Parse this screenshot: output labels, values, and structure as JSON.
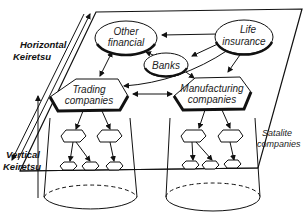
{
  "diagram": {
    "type": "keiretsu-structure",
    "side_labels": {
      "horizontal": [
        "Horizontal",
        "Keiretsu"
      ],
      "vertical": [
        "Vertical",
        "Keiretsu"
      ]
    },
    "nodes": {
      "other_financial": [
        "Other",
        "financial"
      ],
      "life_insurance": [
        "Life",
        "insurance"
      ],
      "banks": "Banks",
      "trading": [
        "Trading",
        "companies"
      ],
      "manufacturing": [
        "Manufacturing",
        "companies"
      ]
    },
    "satellite_label": [
      "Satalite",
      "companies"
    ],
    "edges": [
      {
        "from": "Life insurance",
        "to": "Other financial"
      },
      {
        "from": "Life insurance",
        "to": "Banks"
      },
      {
        "from": "Life insurance",
        "to": "Trading companies"
      },
      {
        "from": "Life insurance",
        "to": "Manufacturing companies"
      },
      {
        "from": "Other financial",
        "to": "Banks",
        "bidirectional": true
      },
      {
        "from": "Other financial",
        "to": "Trading companies",
        "bidirectional": true
      },
      {
        "from": "Banks",
        "to": "Manufacturing companies"
      },
      {
        "from": "Trading companies",
        "to": "Manufacturing companies",
        "bidirectional": true
      }
    ],
    "colors": {
      "stroke": "#111111",
      "background": "#ffffff"
    }
  }
}
